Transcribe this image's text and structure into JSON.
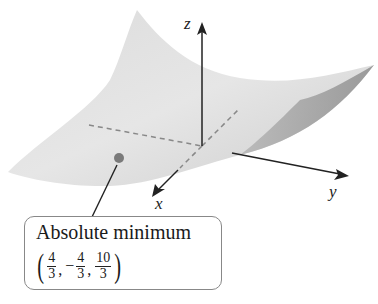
{
  "figure": {
    "type": "3d-surface-plot",
    "axes": {
      "x_label": "x",
      "y_label": "y",
      "z_label": "z"
    },
    "point": {
      "color": "#777777",
      "label": "Absolute minimum"
    },
    "callout": {
      "title": "Absolute minimum",
      "coordinates": {
        "x": {
          "sign": "",
          "num": "4",
          "den": "3"
        },
        "y": {
          "sign": "−",
          "num": "4",
          "den": "3"
        },
        "z": {
          "sign": "",
          "num": "10",
          "den": "3"
        }
      }
    },
    "colors": {
      "surface_light": "#e4e4e4",
      "surface_mid": "#cfcfcf",
      "surface_dark": "#9a9a9a",
      "axis": "#222222",
      "dashed": "#888888"
    }
  }
}
